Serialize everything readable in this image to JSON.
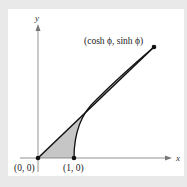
{
  "figure": {
    "type": "hyperbolic-sector",
    "axes": {
      "x_label": "x",
      "y_label": "y"
    },
    "points": {
      "origin": {
        "label": "(0, 0)",
        "x": 0,
        "y": 0
      },
      "unit": {
        "label": "(1, 0)",
        "x": 1,
        "y": 0
      },
      "endpoint": {
        "label": "(cosh ϕ, sinh ϕ)"
      }
    },
    "shaded_region": "sector bounded by ray from origin to (cosh ϕ, sinh ϕ), hyperbola x^2 - y^2 = 1, and x-axis",
    "colors": {
      "background": "#e9e9e9",
      "panel": "#ffffff",
      "shade": "#c8c8c8",
      "lines": "#111111",
      "axes": "#777777"
    }
  }
}
